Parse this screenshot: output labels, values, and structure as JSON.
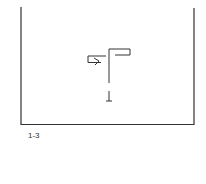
{
  "figure": {
    "panel_label": "1-3",
    "stroke_color": "#333333",
    "symbols": [
      {
        "name": "flag-stem-symbol",
        "description": "vertical stem with flag to the right and box with arrow to the left"
      },
      {
        "name": "ground-tick-symbol",
        "description": "small inverted-T mark below the stem"
      }
    ]
  }
}
